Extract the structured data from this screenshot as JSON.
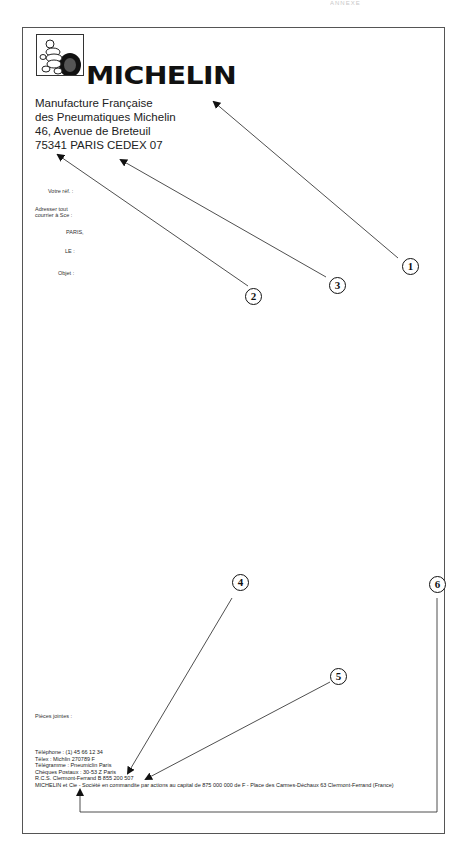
{
  "document": {
    "header_faint": "ANNEXE",
    "brand": {
      "logo_icon": "bibendum-logo-icon",
      "name": "MICHELIN"
    },
    "address": [
      "Manufacture Française",
      "des Pneumatiques Michelin",
      "46, Avenue de Breteuil",
      "75341 PARIS CEDEX 07"
    ],
    "fields": {
      "votre_ref": "Votre réf. :",
      "adresser_line1": "Adresser  tout",
      "adresser_line2": "courrier à Sce :",
      "paris": "PARIS,",
      "le": "LE :",
      "objet": "Objet :"
    },
    "pieces_jointes": "Pièces jointes :",
    "footer": [
      "Téléphone : (1) 45 66 12 34",
      "Télex : Michlin 270789 F",
      "Télégramme : Pneumiclin Paris",
      "Chèques Postaux : 30-53 Z Paris",
      "R.C.S. Clermont-Ferrand B 855 200 507",
      "MICHELIN et Cie - Société en commandite par actions au capital de 875 000 000 de F - Place des Carmes-Déchaux 63 Clermont-Ferrand (France)"
    ],
    "callouts": [
      "1",
      "2",
      "3",
      "4",
      "5",
      "6"
    ]
  }
}
